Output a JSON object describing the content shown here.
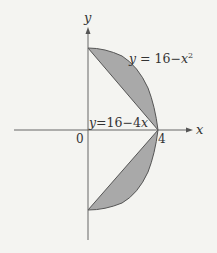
{
  "diagram": {
    "axes": {
      "x_label": "x",
      "y_label": "y",
      "origin_label": "0",
      "x_tick_label": "4"
    },
    "curves": {
      "parabola_label_prefix": "y = 16−x",
      "parabola_label_exp": "2",
      "line_label": "y=16−4x"
    },
    "regions": [
      {
        "name": "upper-region",
        "between": [
          "y = 16 - 4x",
          "y = 16 - x^2"
        ],
        "x_range": [
          0,
          4
        ]
      },
      {
        "name": "lower-region",
        "between": [
          "y = -(16 - 4x)",
          "y = -(16 - x^2)"
        ],
        "x_range": [
          0,
          4
        ]
      }
    ],
    "colors": {
      "background": "#f4f4f1",
      "fill": "#a9a9a9",
      "stroke": "#555555",
      "axis": "#666666",
      "text": "#333333"
    }
  }
}
